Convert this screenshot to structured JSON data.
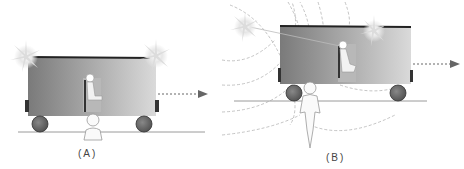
{
  "panels": [
    {
      "id": "A",
      "label": "(A)",
      "caption_x": 78,
      "caption_y": 148
    },
    {
      "id": "B",
      "label": "(B)",
      "caption_x": 326,
      "caption_y": 152
    }
  ],
  "colors": {
    "train_dark": "#7a7a7a",
    "train_light": "#d6d6d6",
    "roof": "#222222",
    "wheel": "#6b6b6b",
    "ground": "#9a9a9a",
    "arrow": "#555555",
    "wave": "#b0b0b0",
    "flash": "#e0e0e0"
  }
}
